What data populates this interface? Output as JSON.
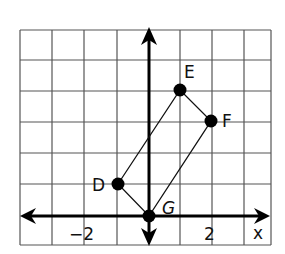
{
  "diagram": {
    "type": "coordinate-plane",
    "grid": {
      "x_min": -4,
      "x_max": 3.85,
      "y_min": -1,
      "y_max": 6
    },
    "axes": {
      "x_label": "x",
      "tick_labels": [
        {
          "axis": "x",
          "value": -2,
          "text": "−2"
        },
        {
          "axis": "x",
          "value": 2,
          "text": "2"
        }
      ]
    },
    "points": [
      {
        "name": "D",
        "x": -1,
        "y": 1
      },
      {
        "name": "E",
        "x": 1,
        "y": 4
      },
      {
        "name": "F",
        "x": 2,
        "y": 3
      },
      {
        "name": "G",
        "x": 0,
        "y": 0
      }
    ],
    "polygon": [
      "D",
      "E",
      "F",
      "G"
    ]
  },
  "labels": {
    "D": "D",
    "E": "E",
    "F": "F",
    "G": "G",
    "x_axis": "x",
    "tick_neg2": "−2",
    "tick_2": "2"
  }
}
